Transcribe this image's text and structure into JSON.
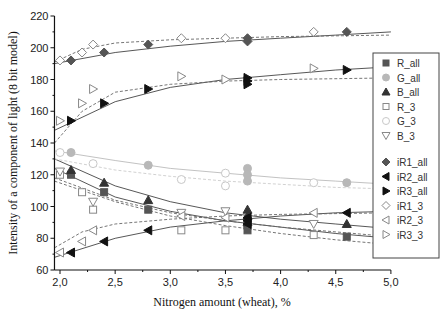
{
  "chart_data": {
    "type": "scatter",
    "title": "",
    "xlabel": "Nitrogen amount (wheat), %",
    "ylabel": "Intensity of a component of light (8 bit model)",
    "xlim": [
      1.95,
      5.0
    ],
    "ylim": [
      60,
      220
    ],
    "xticks": [
      "2,0",
      "2,5",
      "3,0",
      "3,5",
      "4,0",
      "4,5",
      "5,0"
    ],
    "xtick_values": [
      2.0,
      2.5,
      3.0,
      3.5,
      4.0,
      4.5,
      5.0
    ],
    "yticks": [
      "60",
      "80",
      "100",
      "120",
      "140",
      "160",
      "180",
      "200",
      "220"
    ],
    "ytick_values": [
      60,
      80,
      100,
      120,
      140,
      160,
      180,
      200,
      220
    ],
    "grid": false,
    "legend_position": "right-inside",
    "series": [
      {
        "name": "R_all",
        "marker": "square",
        "filled": true,
        "color": "#555555",
        "fit": "solid",
        "points": [
          [
            2.1,
            120
          ],
          [
            2.4,
            109
          ],
          [
            2.8,
            98
          ],
          [
            3.7,
            91
          ],
          [
            3.7,
            88
          ],
          [
            3.7,
            85
          ],
          [
            4.6,
            81
          ]
        ],
        "fit_curve": [
          [
            1.95,
            124
          ],
          [
            2.5,
            106
          ],
          [
            3.0,
            97
          ],
          [
            3.5,
            91
          ],
          [
            4.0,
            87
          ],
          [
            4.5,
            83
          ],
          [
            5.0,
            80
          ]
        ]
      },
      {
        "name": "G_all",
        "marker": "circle",
        "filled": true,
        "color": "#b8b8b8",
        "fit": "solid",
        "points": [
          [
            2.1,
            134
          ],
          [
            2.8,
            126
          ],
          [
            3.7,
            124
          ],
          [
            3.7,
            120
          ],
          [
            3.7,
            116
          ],
          [
            4.6,
            115
          ]
        ],
        "fit_curve": [
          [
            1.95,
            135
          ],
          [
            2.5,
            129
          ],
          [
            3.0,
            124
          ],
          [
            3.5,
            121
          ],
          [
            4.0,
            118
          ],
          [
            4.5,
            116
          ],
          [
            5.0,
            114
          ]
        ]
      },
      {
        "name": "B_all",
        "marker": "triangle-up",
        "filled": true,
        "color": "#333333",
        "fit": "solid",
        "points": [
          [
            2.1,
            123
          ],
          [
            2.4,
            115
          ],
          [
            2.8,
            104
          ],
          [
            3.7,
            98
          ],
          [
            3.7,
            94
          ],
          [
            3.7,
            90
          ],
          [
            4.6,
            89
          ]
        ],
        "fit_curve": [
          [
            1.95,
            130
          ],
          [
            2.5,
            113
          ],
          [
            3.0,
            103
          ],
          [
            3.5,
            96
          ],
          [
            4.0,
            92
          ],
          [
            4.5,
            89
          ],
          [
            5.0,
            86
          ]
        ]
      },
      {
        "name": "R_3",
        "marker": "square",
        "filled": false,
        "color": "#888888",
        "fit": "dashed",
        "points": [
          [
            2.0,
            120
          ],
          [
            2.2,
            109
          ],
          [
            2.3,
            98
          ],
          [
            3.1,
            85
          ],
          [
            3.5,
            85
          ],
          [
            4.3,
            82
          ]
        ],
        "fit_curve": [
          [
            1.95,
            116
          ],
          [
            2.5,
            103
          ],
          [
            3.0,
            94
          ],
          [
            3.5,
            88
          ],
          [
            4.0,
            83
          ],
          [
            4.5,
            79
          ],
          [
            5.0,
            76
          ]
        ]
      },
      {
        "name": "G_3",
        "marker": "circle",
        "filled": false,
        "color": "#c8c8c8",
        "fit": "dashed",
        "points": [
          [
            2.0,
            134
          ],
          [
            2.3,
            127
          ],
          [
            3.1,
            117
          ],
          [
            3.5,
            121
          ],
          [
            3.5,
            113
          ],
          [
            4.3,
            115
          ]
        ],
        "fit_curve": [
          [
            1.95,
            130
          ],
          [
            2.5,
            123
          ],
          [
            3.0,
            119
          ],
          [
            3.5,
            116
          ],
          [
            4.0,
            114
          ],
          [
            4.5,
            112
          ],
          [
            5.0,
            111
          ]
        ]
      },
      {
        "name": "B_3",
        "marker": "triangle-down",
        "filled": false,
        "color": "#888888",
        "fit": "dashed",
        "points": [
          [
            2.0,
            122
          ],
          [
            2.3,
            103
          ],
          [
            3.1,
            96
          ],
          [
            3.5,
            97
          ],
          [
            4.3,
            89
          ]
        ],
        "fit_curve": [
          [
            1.95,
            118
          ],
          [
            2.5,
            104
          ],
          [
            3.0,
            96
          ],
          [
            3.5,
            91
          ],
          [
            4.0,
            87
          ],
          [
            4.5,
            84
          ],
          [
            5.0,
            81
          ]
        ]
      },
      {
        "name": "iR1_all",
        "marker": "diamond",
        "filled": true,
        "color": "#555555",
        "fit": "solid",
        "points": [
          [
            2.1,
            192
          ],
          [
            2.4,
            197
          ],
          [
            2.8,
            202
          ],
          [
            3.7,
            206
          ],
          [
            3.7,
            204
          ],
          [
            4.6,
            210
          ]
        ],
        "fit_curve": [
          [
            1.95,
            190
          ],
          [
            2.5,
            197
          ],
          [
            3.0,
            201
          ],
          [
            3.5,
            204
          ],
          [
            4.0,
            206
          ],
          [
            4.5,
            208
          ],
          [
            5.0,
            210
          ]
        ]
      },
      {
        "name": "iR2_all",
        "marker": "triangle-left",
        "filled": true,
        "color": "#111111",
        "fit": "solid",
        "points": [
          [
            2.1,
            71
          ],
          [
            2.4,
            78
          ],
          [
            2.8,
            85
          ],
          [
            3.7,
            93
          ],
          [
            3.7,
            91
          ],
          [
            3.7,
            89
          ],
          [
            4.6,
            96
          ]
        ],
        "fit_curve": [
          [
            1.95,
            68
          ],
          [
            2.5,
            80
          ],
          [
            3.0,
            87
          ],
          [
            3.5,
            91
          ],
          [
            4.0,
            94
          ],
          [
            4.5,
            96
          ],
          [
            5.0,
            97
          ]
        ]
      },
      {
        "name": "iR3_all",
        "marker": "triangle-right",
        "filled": true,
        "color": "#111111",
        "fit": "solid",
        "points": [
          [
            2.1,
            154
          ],
          [
            2.4,
            165
          ],
          [
            2.8,
            174
          ],
          [
            3.7,
            181
          ],
          [
            3.7,
            179
          ],
          [
            3.7,
            177
          ],
          [
            4.6,
            186
          ]
        ],
        "fit_curve": [
          [
            1.95,
            148
          ],
          [
            2.5,
            166
          ],
          [
            3.0,
            175
          ],
          [
            3.5,
            180
          ],
          [
            4.0,
            183
          ],
          [
            4.5,
            186
          ],
          [
            5.0,
            188
          ]
        ]
      },
      {
        "name": "iR1_3",
        "marker": "diamond",
        "filled": false,
        "color": "#888888",
        "fit": "dashed",
        "points": [
          [
            2.0,
            192
          ],
          [
            2.2,
            197
          ],
          [
            2.3,
            202
          ],
          [
            3.1,
            206
          ],
          [
            3.5,
            206
          ],
          [
            4.3,
            210
          ]
        ],
        "fit_curve": [
          [
            1.95,
            191
          ],
          [
            2.2,
            199
          ],
          [
            2.5,
            203
          ],
          [
            3.0,
            205
          ],
          [
            3.5,
            206
          ],
          [
            4.0,
            207
          ],
          [
            5.0,
            208
          ]
        ]
      },
      {
        "name": "iR2_3",
        "marker": "triangle-left",
        "filled": false,
        "color": "#888888",
        "fit": "dashed",
        "points": [
          [
            2.0,
            71
          ],
          [
            2.2,
            78
          ],
          [
            2.3,
            85
          ],
          [
            3.1,
            94
          ],
          [
            3.5,
            93
          ],
          [
            4.3,
            96
          ]
        ],
        "fit_curve": [
          [
            1.95,
            74
          ],
          [
            2.2,
            84
          ],
          [
            2.5,
            89
          ],
          [
            3.0,
            92
          ],
          [
            3.5,
            94
          ],
          [
            4.0,
            95
          ],
          [
            5.0,
            96
          ]
        ]
      },
      {
        "name": "iR3_3",
        "marker": "triangle-right",
        "filled": false,
        "color": "#888888",
        "fit": "dashed",
        "points": [
          [
            2.0,
            154
          ],
          [
            2.2,
            165
          ],
          [
            2.3,
            174
          ],
          [
            3.1,
            182
          ],
          [
            3.5,
            180
          ],
          [
            4.3,
            187
          ]
        ],
        "fit_curve": [
          [
            1.95,
            140
          ],
          [
            2.2,
            160
          ],
          [
            2.5,
            172
          ],
          [
            3.0,
            177
          ],
          [
            3.5,
            179
          ],
          [
            4.0,
            180
          ],
          [
            5.0,
            181
          ]
        ]
      }
    ]
  }
}
